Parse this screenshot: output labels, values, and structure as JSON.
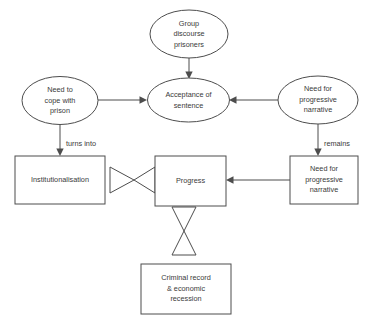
{
  "diagram": {
    "background_color": "#ffffff",
    "line_color": "#4d4d4d",
    "text_color": "#3a3a3a",
    "nodes": [
      {
        "id": "group-discourse-prisoners",
        "shape": "ellipse",
        "lines": [
          "Group",
          "discourse",
          "prisoners"
        ]
      },
      {
        "id": "need-to-cope-with-prison",
        "shape": "ellipse",
        "lines": [
          "Need to",
          "cope with",
          "prison"
        ]
      },
      {
        "id": "acceptance-of-sentence",
        "shape": "ellipse",
        "lines": [
          "Acceptance of",
          "sentence"
        ]
      },
      {
        "id": "need-for-progressive-narrative-ellipse",
        "shape": "ellipse",
        "lines": [
          "Need for",
          "progressive",
          "narrative"
        ]
      },
      {
        "id": "institutionalisation",
        "shape": "rectangle",
        "lines": [
          "Institutionalisation"
        ]
      },
      {
        "id": "progress",
        "shape": "rectangle",
        "lines": [
          "Progress"
        ]
      },
      {
        "id": "need-for-progressive-narrative-box",
        "shape": "rectangle",
        "lines": [
          "Need for",
          "progressive",
          "narrative"
        ]
      },
      {
        "id": "criminal-record-economic-recession",
        "shape": "rectangle",
        "lines": [
          "Criminal record",
          "& economic",
          "recession"
        ]
      }
    ],
    "edge_labels": {
      "turns_into": "turns into",
      "remains": "remains"
    }
  }
}
